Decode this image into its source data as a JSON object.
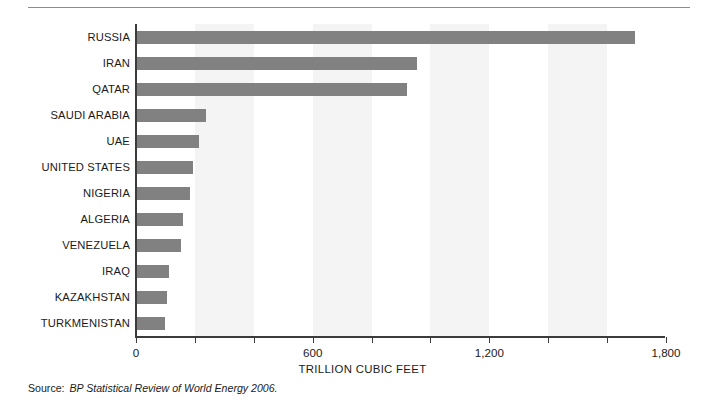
{
  "figure": {
    "source_label": "Source:",
    "source_text": "BP Statistical Review of World Energy 2006."
  },
  "chart_data": {
    "type": "bar",
    "orientation": "horizontal",
    "title": "",
    "xlabel": "TRILLION CUBIC FEET",
    "ylabel": "",
    "xlim": [
      0,
      1800
    ],
    "xticks": [
      0,
      200,
      400,
      600,
      800,
      1000,
      1200,
      1400,
      1600,
      1800
    ],
    "xtick_labels": [
      "0",
      "",
      "",
      "600",
      "",
      "",
      "1,200",
      "",
      "",
      "1,800"
    ],
    "grid": false,
    "banding": true,
    "bar_color": "#818181",
    "band_color": "#f4f4f4",
    "axis_color": "#3b3b3b",
    "categories": [
      "RUSSIA",
      "IRAN",
      "QATAR",
      "SAUDI ARABIA",
      "UAE",
      "UNITED STATES",
      "NIGERIA",
      "ALGERIA",
      "VENEZUELA",
      "IRAQ",
      "KAZAKHSTAN",
      "TURKMENISTAN"
    ],
    "values": [
      1694,
      956,
      922,
      239,
      215,
      193,
      184,
      161,
      152,
      112,
      106,
      100
    ],
    "series": [
      {
        "name": "Proved natural gas reserves",
        "values": [
          1694,
          956,
          922,
          239,
          215,
          193,
          184,
          161,
          152,
          112,
          106,
          100
        ]
      }
    ]
  }
}
